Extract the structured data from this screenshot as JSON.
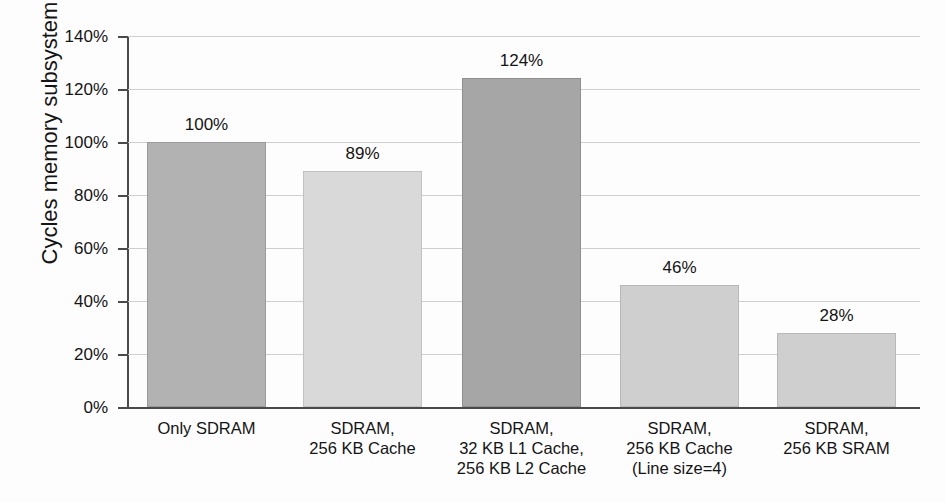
{
  "chart_data": {
    "type": "bar",
    "title": "",
    "xlabel": "",
    "ylabel": "Cycles memory subsystem",
    "ylim": [
      0,
      140
    ],
    "grid": true,
    "legend": "none",
    "ytick_labels": [
      "140%",
      "120%",
      "100%",
      "80%",
      "60%",
      "40%",
      "20%",
      "0%"
    ],
    "ytick_values": [
      140,
      120,
      100,
      80,
      60,
      40,
      20,
      0
    ],
    "categories": [
      "Only SDRAM",
      "SDRAM,\n256 KB Cache",
      "SDRAM,\n32 KB L1 Cache,\n256 KB L2 Cache",
      "SDRAM,\n256 KB Cache\n(Line size=4)",
      "SDRAM,\n256 KB SRAM"
    ],
    "category_lines": [
      [
        "Only SDRAM"
      ],
      [
        "SDRAM,",
        "256 KB Cache"
      ],
      [
        "SDRAM,",
        "32 KB L1 Cache,",
        "256 KB L2 Cache"
      ],
      [
        "SDRAM,",
        "256 KB Cache",
        "(Line size=4)"
      ],
      [
        "SDRAM,",
        "256 KB SRAM"
      ]
    ],
    "values": [
      100,
      89,
      124,
      46,
      28
    ],
    "value_labels": [
      "100%",
      "89%",
      "124%",
      "46%",
      "28%"
    ],
    "bar_colors": [
      "#b2b2b2",
      "#d9d9d9",
      "#a6a6a6",
      "#cfcfcf",
      "#cfcfcf"
    ],
    "bar_border_colors": [
      "#9a9a9a",
      "#c2c2c2",
      "#8f8f8f",
      "#b8b8b8",
      "#b8b8b8"
    ]
  },
  "axis": {
    "y_title": "Cycles memory subsystem"
  }
}
